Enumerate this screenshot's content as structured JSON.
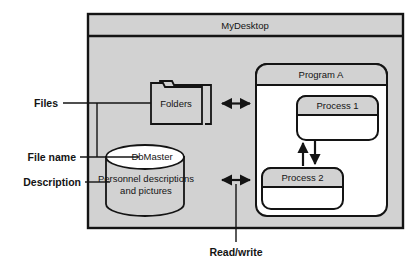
{
  "diagram": {
    "desktop": {
      "title": "MyDesktop",
      "fill_color": "#d2d2d2",
      "border_color": "#141414"
    },
    "folders": {
      "label": "Folders",
      "icon": "folder-icon",
      "fill_color": "#d2d2d2"
    },
    "database": {
      "top_label": "DbMaster",
      "body_label_line1": "Personnel descriptions",
      "body_label_line2": "and pictures",
      "top_fill_color": "#ffffff",
      "body_fill_color": "#d2d2d2"
    },
    "program": {
      "title": "Program A",
      "title_fill_color": "#d2d2d2",
      "body_fill_color": "#ffffff",
      "processes": [
        {
          "title": "Process 1"
        },
        {
          "title": "Process 2"
        }
      ]
    },
    "callouts": [
      {
        "label": "Files"
      },
      {
        "label": "File name"
      },
      {
        "label": "Description"
      },
      {
        "label": "Read/write"
      }
    ],
    "connectors": [
      {
        "name": "folders-program-a",
        "kind": "double-arrow"
      },
      {
        "name": "database-process-2",
        "kind": "double-arrow"
      },
      {
        "name": "process2-to-process1",
        "kind": "arrow-up"
      },
      {
        "name": "process1-to-process2",
        "kind": "arrow-down"
      }
    ]
  }
}
